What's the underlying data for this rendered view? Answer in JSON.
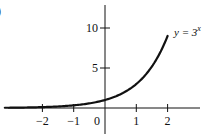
{
  "chart_data": {
    "type": "line",
    "title": "",
    "function_label": "y = 3^x",
    "function_label_base": "y = 3",
    "function_label_exponent": "x",
    "xlabel": "",
    "ylabel": "",
    "x_ticks": [
      -2,
      -1,
      0,
      1,
      2
    ],
    "x_tick_labels": [
      "−2",
      "−1",
      "0",
      "1",
      "2"
    ],
    "y_ticks": [
      5,
      10
    ],
    "y_tick_labels": [
      "5",
      "10"
    ],
    "xlim": [
      -3.3,
      3.0
    ],
    "ylim": [
      -3,
      13
    ],
    "grid": false,
    "legend": "none",
    "series": [
      {
        "name": "y = 3^x",
        "x": [
          -3.2,
          -3,
          -2.5,
          -2,
          -1.5,
          -1,
          -0.5,
          0,
          0.5,
          1,
          1.5,
          2
        ],
        "y": [
          0.03,
          0.04,
          0.06,
          0.11,
          0.19,
          0.33,
          0.58,
          1,
          1.73,
          3,
          5.2,
          9
        ]
      }
    ],
    "colors": {
      "axis": "#111111",
      "curve": "#111111",
      "text": "#111111"
    }
  },
  "corner_mark": ")"
}
